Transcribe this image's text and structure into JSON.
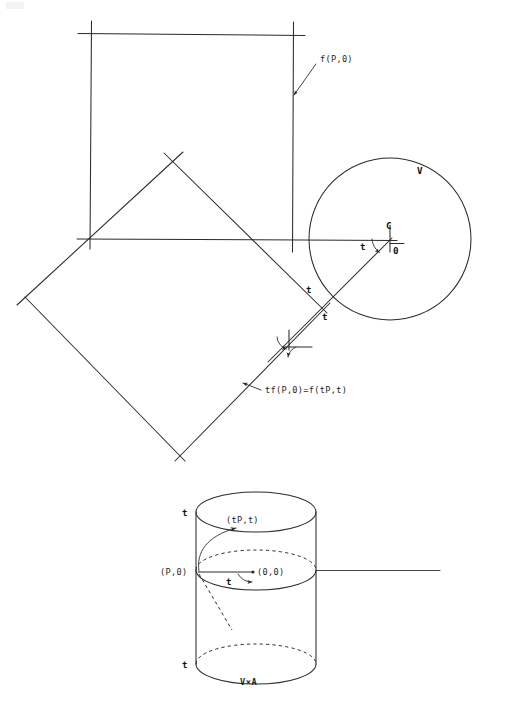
{
  "figure": {
    "caption_bottom": "V×A",
    "upper_diagram": {
      "name": "square-and-diamond-with-circle",
      "labels": {
        "f_p_0": "f(P,0)",
        "circle_region": "V",
        "center_point": "C",
        "zero_point": "0",
        "angle_center": "t",
        "angle_intersect_upper": "t",
        "angle_intersect_lower": "t",
        "tf_identity": "tf(P,0)=f(tP,t)"
      },
      "geometry": {
        "square": {
          "x0": 90,
          "y0": 32,
          "x1": 293,
          "y1": 239,
          "overshoot": 12
        },
        "diamond": {
          "cx": 172,
          "cy": 314,
          "rx": 147,
          "ry": 160,
          "overshoot": 13
        },
        "circle": {
          "cx": 390,
          "cy": 239,
          "r": 81
        },
        "horizontal_axis": {
          "x0": 77,
          "x1": 397,
          "y": 239
        },
        "ray": {
          "x0": 390,
          "y0": 239,
          "x1": 283,
          "y1": 346
        }
      }
    },
    "lower_diagram": {
      "name": "cylinder-v-cross-a",
      "labels": {
        "top_t": "t",
        "bottom_t": "t",
        "point_tp_t": "(tP,t)",
        "point_p_0": "(P,0)",
        "point_0_0": "(0,0)",
        "angle_t": "t"
      },
      "geometry": {
        "cx": 256,
        "rx": 60,
        "ry": 20,
        "top_y": 512,
        "mid_y": 570,
        "bottom_y": 664
      }
    },
    "colors": {
      "ink": "#2b2b2b",
      "text": "#1f1f1f",
      "paper": "#ffffff"
    }
  }
}
